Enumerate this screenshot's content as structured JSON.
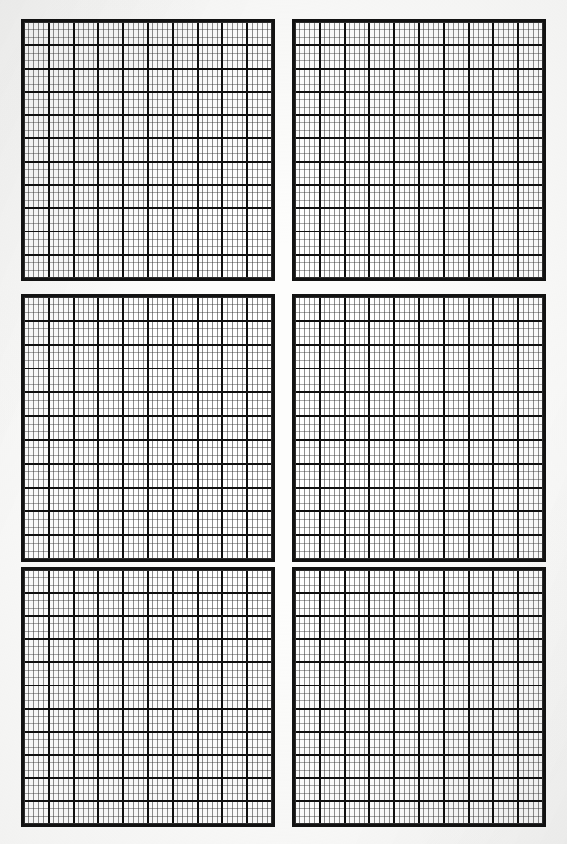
{
  "document": {
    "kind": "graph-paper-sheet",
    "page_width": 567,
    "page_height": 844,
    "background_color": "#fdfdfc",
    "ink_color": "#121212",
    "minor_rule_color": "#3a3a3a",
    "major_rule_color": "#141414",
    "panel_count": 6,
    "panel_rows": 3,
    "panel_columns": 2,
    "caption": ""
  },
  "grid_spec": {
    "major_columns": 10,
    "minor_per_major_column": 5,
    "major_rows": 11,
    "minor_per_major_row": 3,
    "major_rule_width_px": 1.9,
    "minor_rule_width_px": 0.7,
    "frame_width_px": 3
  },
  "panels": [
    {
      "id": "panel-top-left",
      "label": "Panel 1",
      "x": 21,
      "y": 19,
      "width": 254,
      "height": 262,
      "major_columns": 10,
      "minor_per_major_column": 5,
      "major_rows": 11,
      "minor_per_major_row": 3,
      "content": ""
    },
    {
      "id": "panel-top-right",
      "label": "Panel 2",
      "x": 292,
      "y": 19,
      "width": 254,
      "height": 262,
      "major_columns": 10,
      "minor_per_major_column": 5,
      "major_rows": 11,
      "minor_per_major_row": 3,
      "content": ""
    },
    {
      "id": "panel-middle-left",
      "label": "Panel 3",
      "x": 21,
      "y": 294,
      "width": 254,
      "height": 268,
      "major_columns": 10,
      "minor_per_major_column": 5,
      "major_rows": 11,
      "minor_per_major_row": 3,
      "content": ""
    },
    {
      "id": "panel-middle-right",
      "label": "Panel 4",
      "x": 292,
      "y": 294,
      "width": 254,
      "height": 268,
      "major_columns": 10,
      "minor_per_major_column": 5,
      "major_rows": 11,
      "minor_per_major_row": 3,
      "content": ""
    },
    {
      "id": "panel-bottom-left",
      "label": "Panel 5",
      "x": 21,
      "y": 567,
      "width": 254,
      "height": 260,
      "major_columns": 10,
      "minor_per_major_column": 5,
      "major_rows": 11,
      "minor_per_major_row": 3,
      "content": ""
    },
    {
      "id": "panel-bottom-right",
      "label": "Panel 6",
      "x": 292,
      "y": 567,
      "width": 254,
      "height": 260,
      "major_columns": 10,
      "minor_per_major_column": 5,
      "major_rows": 11,
      "minor_per_major_row": 3,
      "content": ""
    }
  ],
  "chart_data": {
    "type": "table",
    "title": "",
    "xlabel": "",
    "ylabel": "",
    "categories": [
      "panel-top-left",
      "panel-top-right",
      "panel-middle-left",
      "panel-middle-right",
      "panel-bottom-left",
      "panel-bottom-right"
    ],
    "values": [
      0,
      0,
      0,
      0,
      0,
      0
    ],
    "series": [],
    "tick_labels_x": [],
    "tick_labels_y": [],
    "legend": [],
    "annotations": [],
    "grid": true,
    "legend_position": "none"
  }
}
